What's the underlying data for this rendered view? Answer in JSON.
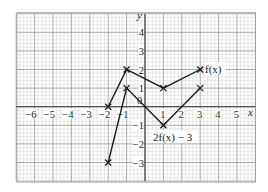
{
  "chart_data": {
    "type": "line",
    "title": "",
    "xlabel": "x",
    "ylabel": "y",
    "xlim": [
      -7,
      6
    ],
    "ylim": [
      -4,
      5
    ],
    "grid": true,
    "grid_minor_divisions": 5,
    "x_ticks": [
      -6,
      -5,
      -4,
      -3,
      -2,
      -1,
      0,
      1,
      2,
      3,
      4,
      5
    ],
    "y_ticks": [
      -3,
      -2,
      -1,
      1,
      2,
      3,
      4
    ],
    "x_tick_labels": [
      "−6",
      "−5",
      "−4",
      "−3",
      "−2",
      "−1",
      "0",
      "1",
      "2",
      "3",
      "4",
      "5"
    ],
    "y_tick_labels": [
      "−3",
      "−2",
      "−1",
      "1",
      "2",
      "3",
      "4"
    ],
    "series": [
      {
        "name": "f(x)",
        "label": "f(x)",
        "marker": "x",
        "points": [
          [
            -2,
            0
          ],
          [
            -1,
            2
          ],
          [
            1,
            1
          ],
          [
            3,
            2
          ]
        ]
      },
      {
        "name": "2f(x) − 3",
        "label": "2f(x) − 3",
        "marker": "x",
        "points": [
          [
            -2,
            -3
          ],
          [
            -1,
            1
          ],
          [
            1,
            -1
          ],
          [
            3,
            1
          ]
        ]
      }
    ],
    "annotations": [
      {
        "text": "f(x)",
        "at": [
          3,
          2
        ],
        "position": "right"
      },
      {
        "text": "2f(x) − 3",
        "at": [
          1,
          -1
        ],
        "position": "below"
      }
    ]
  },
  "labels": {
    "x_axis": "x",
    "y_axis": "y",
    "origin": "0",
    "curve_f": "f(x)",
    "curve_g": "2f(x) − 3"
  },
  "colors": {
    "major_grid": "#8a8a8a",
    "minor_grid": "#d2d2d2",
    "axis": "#333333",
    "line": "#1a1a1a"
  }
}
